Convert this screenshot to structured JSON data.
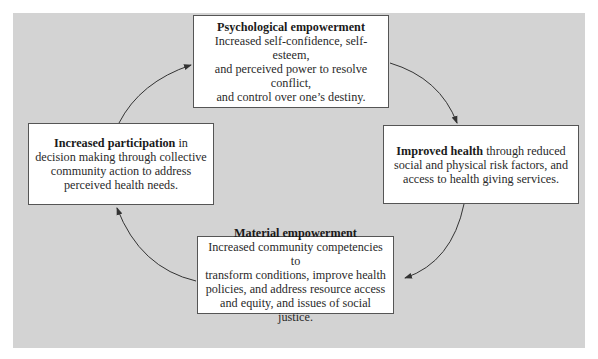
{
  "diagram": {
    "type": "cycle",
    "nodes": [
      {
        "id": "psychological",
        "title": "Psychological empowerment",
        "lines": [
          "Increased self-confidence, self-esteem,",
          "and perceived power to resolve conflict,",
          "and control over one’s destiny."
        ]
      },
      {
        "id": "health",
        "title": "Improved health",
        "title_suffix": " through reduced",
        "lines": [
          "social and physical risk factors, and",
          "access to health giving services."
        ]
      },
      {
        "id": "material",
        "title": "Material empowerment",
        "lines": [
          "Increased community competencies to",
          "transform conditions, improve health",
          "policies, and address resource access",
          "and equity, and issues of social justice."
        ]
      },
      {
        "id": "participation",
        "title": "Increased participation",
        "title_suffix": " in",
        "lines": [
          "decision making through collective",
          "community action to address",
          "perceived health needs."
        ]
      }
    ],
    "edges": [
      {
        "from": "participation",
        "to": "psychological"
      },
      {
        "from": "psychological",
        "to": "health"
      },
      {
        "from": "health",
        "to": "material"
      },
      {
        "from": "material",
        "to": "participation"
      }
    ],
    "colors": {
      "background": "#d3d3d3",
      "box_fill": "#ffffff",
      "box_border": "#555555",
      "arrow": "#333333"
    }
  }
}
